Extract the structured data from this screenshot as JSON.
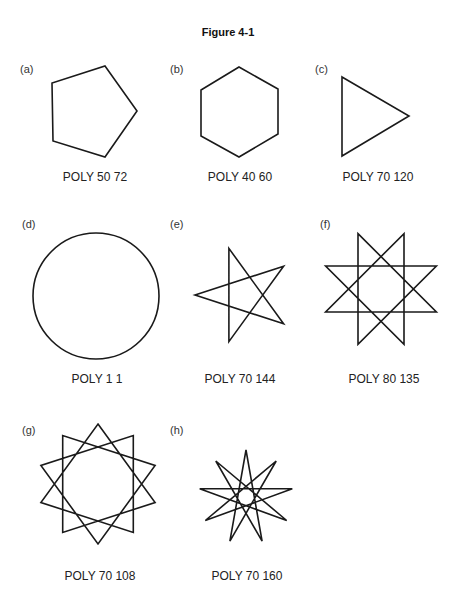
{
  "title": "Figure 4-1",
  "panels": [
    {
      "letter": "(a)",
      "caption": "POLY 50 72",
      "side": 50,
      "angle": 72,
      "shape": "pentagon"
    },
    {
      "letter": "(b)",
      "caption": "POLY 40 60",
      "side": 40,
      "angle": 60,
      "shape": "hexagon"
    },
    {
      "letter": "(c)",
      "caption": "POLY 70 120",
      "side": 70,
      "angle": 120,
      "shape": "triangle"
    },
    {
      "letter": "(d)",
      "caption": "POLY 1 1",
      "side": 1,
      "angle": 1,
      "shape": "circle"
    },
    {
      "letter": "(e)",
      "caption": "POLY 70 144",
      "side": 70,
      "angle": 144,
      "shape": "5-pointed star"
    },
    {
      "letter": "(f)",
      "caption": "POLY 80 135",
      "side": 80,
      "angle": 135,
      "shape": "8-pointed star"
    },
    {
      "letter": "(g)",
      "caption": "POLY 70 108",
      "side": 70,
      "angle": 108,
      "shape": "10-pointed star"
    },
    {
      "letter": "(h)",
      "caption": "POLY 70 160",
      "side": 70,
      "angle": 160,
      "shape": "9-pointed star"
    }
  ]
}
